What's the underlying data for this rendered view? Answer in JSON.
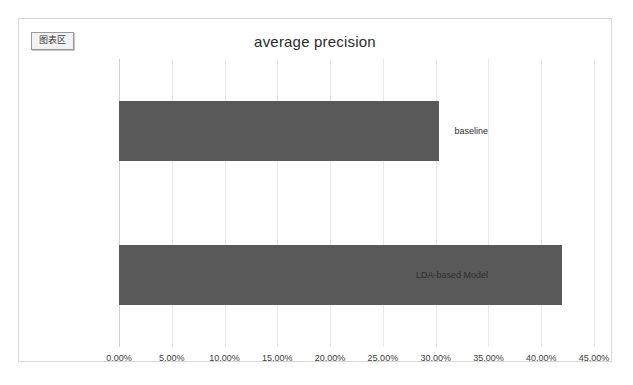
{
  "chart_area_badge": {
    "label": "图表区"
  },
  "chart_data": {
    "type": "bar",
    "orientation": "horizontal",
    "title": "average precision",
    "xlabel": "",
    "ylabel": "",
    "categories": [
      "baseline",
      "LDA-based Model"
    ],
    "values": [
      0.303,
      0.42
    ],
    "value_labels": [
      "30.30%",
      "42.00%"
    ],
    "xlim": [
      0,
      0.45
    ],
    "xticks": [
      0,
      0.05,
      0.1,
      0.15,
      0.2,
      0.25,
      0.3,
      0.35,
      0.4,
      0.45
    ],
    "xtick_labels": [
      "0.00%",
      "5.00%",
      "10.00%",
      "15.00%",
      "20.00%",
      "25.00%",
      "30.00%",
      "35.00%",
      "40.00%",
      "45.00%"
    ],
    "grid": true,
    "grid_axis": "x",
    "legend": false,
    "legend_position": "none",
    "bar_color": "#595959",
    "gridline_color": "#e9e9e9",
    "plot_background": "#ffffff"
  }
}
